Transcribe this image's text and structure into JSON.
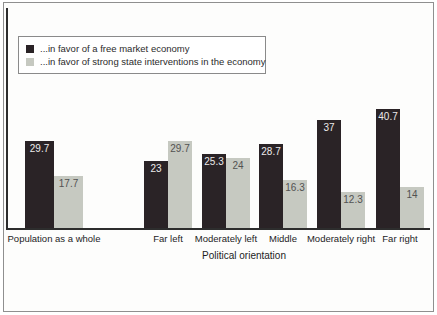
{
  "chart_data": {
    "type": "bar",
    "categories": [
      "Population as a whole",
      "Far left",
      "Moderately left",
      "Middle",
      "Moderately right",
      "Far right"
    ],
    "series": [
      {
        "name": "...in favor of a free market economy",
        "color": "#2a2326",
        "value_label_color": "#eceaea",
        "values": [
          29.7,
          23,
          25.3,
          28.7,
          37,
          40.7
        ]
      },
      {
        "name": "...in favor of strong state interventions in the economy",
        "color": "#c6c9c1",
        "value_label_color": "#525252",
        "values": [
          17.7,
          29.7,
          24,
          16.3,
          12.3,
          14
        ]
      }
    ],
    "title": "",
    "xlabel": "Political orientation",
    "ylabel": "",
    "ylim": [
      0,
      45
    ],
    "grid": false,
    "legend_position": "top-left",
    "frame_color": "#8f8f8f",
    "axis_color": "#2d2d2d"
  }
}
